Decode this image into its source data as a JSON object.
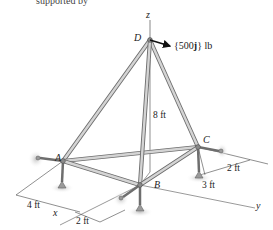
{
  "header": {
    "cut_off_text": "supported by"
  },
  "points": {
    "D": {
      "label": "D",
      "x": 150,
      "y": 40
    },
    "A": {
      "label": "A",
      "x": 63,
      "y": 161
    },
    "B": {
      "label": "B",
      "x": 140,
      "y": 185
    },
    "C": {
      "label": "C",
      "x": 198,
      "y": 147
    }
  },
  "axes": {
    "z": "z",
    "x": "x",
    "y": "y"
  },
  "load": {
    "label_prefix": "{500",
    "label_bold": "j",
    "label_suffix": "} lb"
  },
  "dimensions": {
    "height": "8 ft",
    "a_offset": "4 ft",
    "b_offset": "2 ft",
    "c_offset_y": "3 ft",
    "c_offset_x": "2 ft"
  },
  "colors": {
    "member": "#b9b9b9",
    "member_edge": "#6e6e6e",
    "line": "#333333",
    "support_shadow": "#cfcfcf"
  }
}
